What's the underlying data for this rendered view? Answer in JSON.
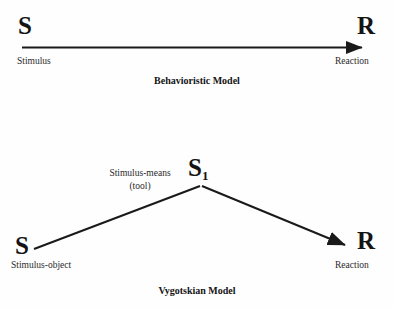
{
  "figure": {
    "background_color": "#fefefe",
    "stroke_color": "#1a1a1a"
  },
  "diagrams": [
    {
      "id": "behavioristic",
      "caption": "Behavioristic Model",
      "nodes": [
        {
          "key": "s",
          "symbol": "S",
          "sublabel": "Stimulus"
        },
        {
          "key": "r",
          "symbol": "R",
          "sublabel": "Reaction"
        }
      ],
      "edges": [
        {
          "from": "S",
          "to": "R",
          "arrow": true
        }
      ]
    },
    {
      "id": "vygotskian",
      "caption": "Vygotskian Model",
      "nodes": [
        {
          "key": "s",
          "symbol": "S",
          "sublabel": "Stimulus-object"
        },
        {
          "key": "s1",
          "symbol": "S",
          "subscript": "1",
          "sublabel": ""
        },
        {
          "key": "r",
          "symbol": "R",
          "sublabel": "Reaction"
        }
      ],
      "annotations": [
        {
          "key": "tool",
          "line1": "Stimulus-means",
          "line2": "(tool)"
        }
      ],
      "edges": [
        {
          "from": "S",
          "to": "S1",
          "arrow": false
        },
        {
          "from": "S1",
          "to": "R",
          "arrow": true
        }
      ]
    }
  ]
}
